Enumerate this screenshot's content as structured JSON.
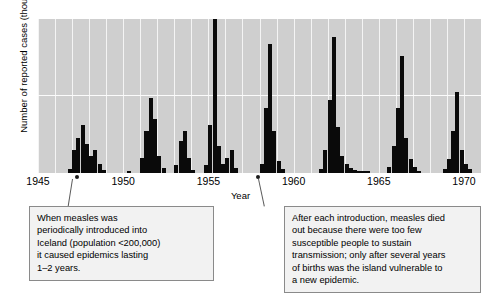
{
  "chart_data": {
    "type": "bar",
    "title": "",
    "subtitle": "",
    "xlabel": "Year",
    "ylabel": "Number of reported cases (thousands)",
    "xlim": [
      1945,
      1971
    ],
    "ylim": [
      0,
      2
    ],
    "y_ticks": [
      "0",
      "1",
      "2"
    ],
    "y_tick_values": [
      0,
      1,
      2
    ],
    "x_ticks": [
      "1945",
      "1950",
      "1955",
      "1960",
      "1965",
      "1970"
    ],
    "x_tick_values": [
      1945,
      1950,
      1955,
      1960,
      1965,
      1970
    ],
    "grid": "vertical white gridlines each year, one horizontal gridline at y=1",
    "legend": "none",
    "plot_background": "#cfcfcf",
    "bar_color": "#0a0a0a",
    "series_name": "Reported measles cases in Iceland",
    "x": [
      1945.0,
      1945.25,
      1945.5,
      1945.75,
      1946.0,
      1946.25,
      1946.5,
      1946.75,
      1947.0,
      1947.25,
      1947.5,
      1947.75,
      1948.0,
      1948.25,
      1948.5,
      1948.75,
      1949.0,
      1949.25,
      1949.5,
      1949.75,
      1950.0,
      1950.25,
      1950.5,
      1950.75,
      1951.0,
      1951.25,
      1951.5,
      1951.75,
      1952.0,
      1952.25,
      1952.5,
      1952.75,
      1953.0,
      1953.25,
      1953.5,
      1953.75,
      1954.0,
      1954.25,
      1954.5,
      1954.75,
      1955.0,
      1955.25,
      1955.5,
      1955.75,
      1956.0,
      1956.25,
      1956.5,
      1956.75,
      1957.0,
      1957.25,
      1957.5,
      1957.75,
      1958.0,
      1958.25,
      1958.5,
      1958.75,
      1959.0,
      1959.25,
      1959.5,
      1959.75,
      1960.0,
      1960.25,
      1960.5,
      1960.75,
      1961.0,
      1961.25,
      1961.5,
      1961.75,
      1962.0,
      1962.25,
      1962.5,
      1962.75,
      1963.0,
      1963.25,
      1963.5,
      1963.75,
      1964.0,
      1964.25,
      1964.5,
      1964.75,
      1965.0,
      1965.25,
      1965.5,
      1965.75,
      1966.0,
      1966.25,
      1966.5,
      1966.75,
      1967.0,
      1967.25,
      1967.5,
      1967.75,
      1968.0,
      1968.25,
      1968.5,
      1968.75,
      1969.0,
      1969.25,
      1969.5,
      1969.75,
      1970.0,
      1970.25,
      1970.5,
      1970.75
    ],
    "values": [
      0,
      0,
      0,
      0,
      0,
      0,
      0,
      0.05,
      0.3,
      0.45,
      0.62,
      0.38,
      0.22,
      0.3,
      0.12,
      0.04,
      0,
      0,
      0,
      0,
      0,
      0.02,
      0,
      0,
      0.2,
      0.55,
      0.97,
      0.7,
      0.22,
      0.06,
      0,
      0,
      0.1,
      0.42,
      0.55,
      0.2,
      0.04,
      0,
      0,
      0.1,
      0.62,
      2.0,
      0.35,
      0.12,
      0.2,
      0.3,
      0.06,
      0,
      0,
      0,
      0,
      0,
      0.12,
      0.85,
      1.68,
      0.55,
      0.15,
      0.05,
      0,
      0,
      0,
      0,
      0,
      0,
      0,
      0,
      0.05,
      0.3,
      0.95,
      1.77,
      0.6,
      0.22,
      0.12,
      0.06,
      0.04,
      0.03,
      0.03,
      0.02,
      0,
      0,
      0,
      0,
      0.08,
      0.35,
      0.85,
      1.52,
      0.45,
      0.18,
      0.08,
      0.03,
      0,
      0,
      0,
      0,
      0,
      0.05,
      0.18,
      0.55,
      1.05,
      0.3,
      0.12,
      0.05,
      0,
      0
    ],
    "annotations": [
      {
        "id": "left",
        "text": "When measles was periodically introduced into Iceland (population <200,000) it caused epidemics lasting 1–2 years.",
        "lines": [
          "When measles was",
          "periodically introduced into",
          "Iceland (population <200,000)",
          "it caused epidemics lasting",
          "1–2 years."
        ],
        "points_to_year": 1947.5
      },
      {
        "id": "right",
        "text": "After each introduction, measles died out because there were too few susceptible people to sustain transmission; only after several years of births was the island vulnerable to a new epidemic.",
        "lines": [
          "After each introduction, measles died",
          "out because there were too few",
          "susceptible people to sustain",
          "transmission; only after several years",
          "of births was the island vulnerable to",
          "a new epidemic."
        ],
        "points_to_year": 1961.3
      }
    ]
  }
}
